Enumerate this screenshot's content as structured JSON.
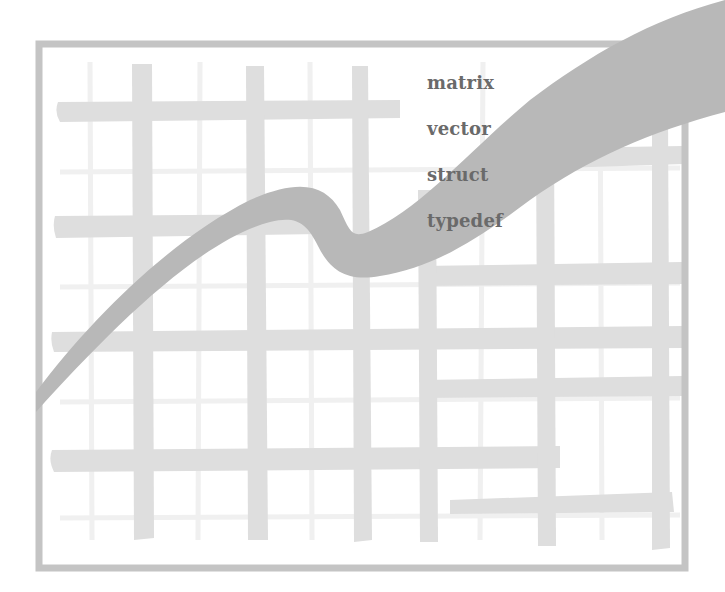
{
  "illustration": {
    "description": "Decorative chart-like illustration: hand-drawn grid inside a gray frame with a thick rising wavy curve",
    "labels": [
      "matrix",
      "vector",
      "struct",
      "typedef"
    ],
    "colors": {
      "background": "#ffffff",
      "frame": "#c4c4c4",
      "thick_grid": "#dedede",
      "thin_grid": "#f0f0f0",
      "curve": "#b8b8b8",
      "label_text": "#6a6a6a"
    }
  }
}
